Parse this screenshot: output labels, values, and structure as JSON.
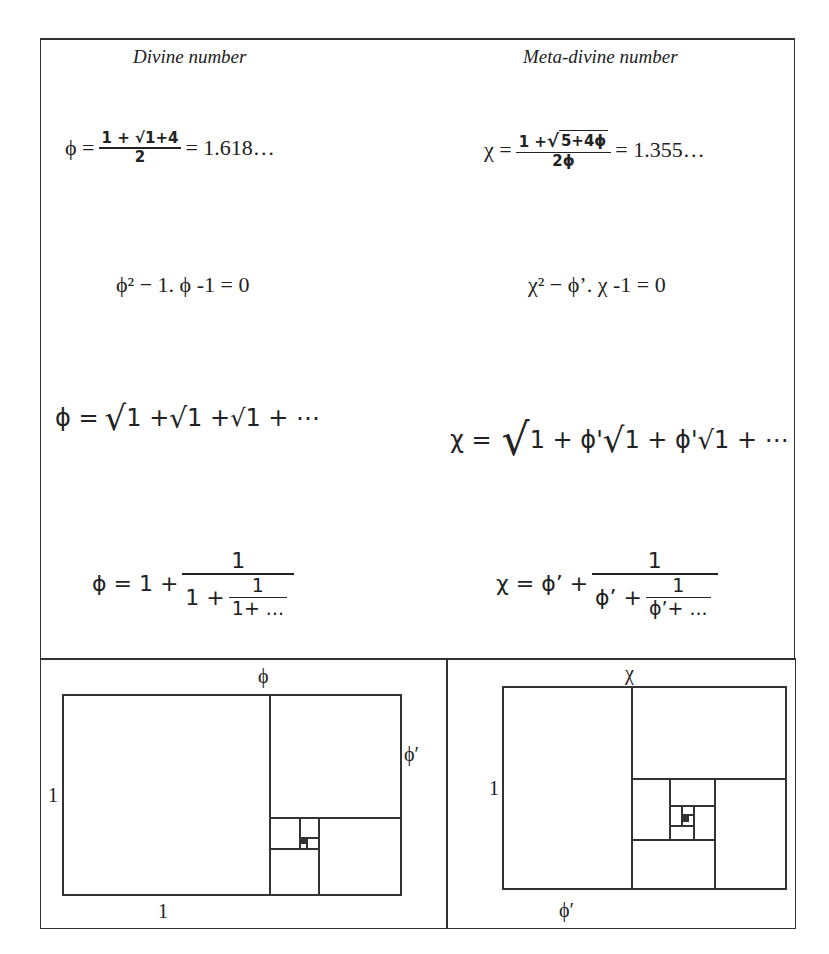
{
  "headers": {
    "left": "Divine number",
    "right": "Meta-divine number"
  },
  "left_column": {
    "closed_form": {
      "lhs": "ϕ =",
      "numerator": "1 + √1+4",
      "denominator": "2",
      "rhs": "= 1.618…"
    },
    "quadratic": "ϕ² − 1. ϕ -1 = 0",
    "nested_radical": {
      "lhs": "ϕ =",
      "terms": [
        "1 +",
        "1 +",
        "1 + ⋯"
      ]
    },
    "continued_fraction": {
      "lhs": "ϕ = 1 +",
      "numerator": "1",
      "inner_whole": "1 +",
      "inner_numerator": "1",
      "inner_denominator": "1+ ..."
    }
  },
  "right_column": {
    "closed_form": {
      "lhs": "χ =",
      "numerator_prefix": "1 +",
      "numerator_radicand": "5+4ϕ",
      "denominator": "2ϕ",
      "rhs": "= 1.355…"
    },
    "quadratic": "χ² − ϕ’. χ -1 = 0",
    "nested_radical": {
      "lhs": "χ =",
      "terms": [
        "1 + ϕ'",
        "1 + ϕ'",
        "1 + ⋯"
      ]
    },
    "continued_fraction": {
      "lhs": "χ = ϕ’ +",
      "numerator": "1",
      "inner_whole": "ϕ’ +",
      "inner_numerator": "1",
      "inner_denominator": "ϕ’+ ..."
    }
  },
  "diagrams": {
    "left": {
      "top_label": "ϕ",
      "right_label": "ϕ′",
      "left_label": "1",
      "bottom_label": "1"
    },
    "right": {
      "top_label": "χ",
      "left_label": "1",
      "bottom_label": "ϕ′"
    }
  },
  "colors": {
    "line": "#333333",
    "text": "#222222",
    "background": "#ffffff"
  }
}
